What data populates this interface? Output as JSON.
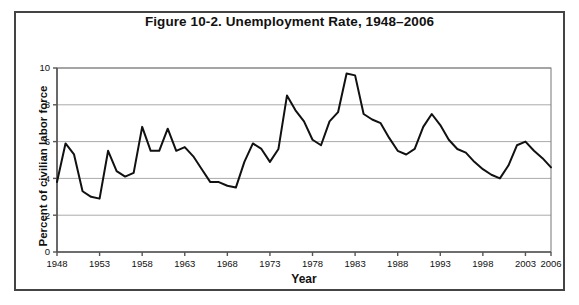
{
  "scan": {
    "top_artifact_text": ""
  },
  "figure": {
    "title": "Figure 10-2. Unemployment Rate, 1948–2006",
    "xlabel": "Year",
    "ylabel": "Percent of civilian labor force",
    "border_color": "#444444",
    "line_color": "#111111",
    "grid_color": "#aaaaaa",
    "background": "#ffffff"
  },
  "chart_data": {
    "type": "line",
    "title": "Figure 10-2. Unemployment Rate, 1948–2006",
    "xlabel": "Year",
    "ylabel": "Percent of civilian labor force",
    "xlim": [
      1948,
      2006
    ],
    "ylim": [
      0,
      10
    ],
    "yticks": [
      0,
      2,
      4,
      6,
      8,
      10
    ],
    "ytick_labels": [
      "0",
      "2",
      "4",
      "6",
      "8",
      "10"
    ],
    "xticks": [
      1948,
      1953,
      1958,
      1963,
      1968,
      1973,
      1978,
      1983,
      1988,
      1993,
      1998,
      2003,
      2006
    ],
    "xtick_labels": [
      "1948",
      "1953",
      "1958",
      "1963",
      "1968",
      "1973",
      "1978",
      "1983",
      "1988",
      "1993",
      "1998",
      "2003",
      "2006"
    ],
    "grid": "horizontal",
    "legend": null,
    "series": [
      {
        "name": "Unemployment rate",
        "color": "#111111",
        "x": [
          1948,
          1949,
          1950,
          1951,
          1952,
          1953,
          1954,
          1955,
          1956,
          1957,
          1958,
          1959,
          1960,
          1961,
          1962,
          1963,
          1964,
          1965,
          1966,
          1967,
          1968,
          1969,
          1970,
          1971,
          1972,
          1973,
          1974,
          1975,
          1976,
          1977,
          1978,
          1979,
          1980,
          1981,
          1982,
          1983,
          1984,
          1985,
          1986,
          1987,
          1988,
          1989,
          1990,
          1991,
          1992,
          1993,
          1994,
          1995,
          1996,
          1997,
          1998,
          1999,
          2000,
          2001,
          2002,
          2003,
          2004,
          2005,
          2006
        ],
        "values": [
          3.8,
          5.9,
          5.3,
          3.3,
          3.0,
          2.9,
          5.5,
          4.4,
          4.1,
          4.3,
          6.8,
          5.5,
          5.5,
          6.7,
          5.5,
          5.7,
          5.2,
          4.5,
          3.8,
          3.8,
          3.6,
          3.5,
          4.9,
          5.9,
          5.6,
          4.9,
          5.6,
          8.5,
          7.7,
          7.1,
          6.1,
          5.8,
          7.1,
          7.6,
          9.7,
          9.6,
          7.5,
          7.2,
          7.0,
          6.2,
          5.5,
          5.3,
          5.6,
          6.8,
          7.5,
          6.9,
          6.1,
          5.6,
          5.4,
          4.9,
          4.5,
          4.2,
          4.0,
          4.7,
          5.8,
          6.0,
          5.5,
          5.1,
          4.6
        ]
      }
    ]
  }
}
